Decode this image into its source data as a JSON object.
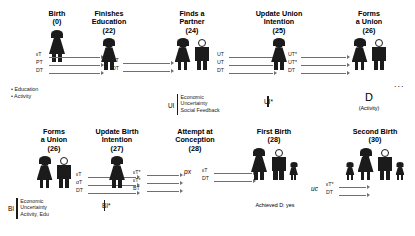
{
  "diagram": {
    "row1": {
      "nodes": [
        {
          "id": "birth",
          "title": "Birth",
          "age": "(0)",
          "figures": [
            "woman"
          ],
          "bullets": "• Education\n• Activity"
        },
        {
          "id": "finishes-education",
          "title": "Finishes\nEducation",
          "age": "(22)",
          "figures": [
            "woman"
          ]
        },
        {
          "id": "finds-a-partner",
          "title": "Finds a\nPartner",
          "age": "(24)",
          "figures": [
            "woman",
            "man"
          ],
          "annotation": {
            "key": "UI",
            "lines": "Economic\nUncertainty\nSocial Feedback"
          }
        },
        {
          "id": "update-union-intention",
          "title": "Update Union\nIntention",
          "age": "(25)",
          "figures": [
            "woman"
          ],
          "annotation": {
            "key": "UI*",
            "lines": ""
          }
        },
        {
          "id": "forms-a-union",
          "title": "Forms\na Union",
          "age": "(26)",
          "figures": [
            "woman",
            "man"
          ],
          "bigletter": "D",
          "sublabel": "(Activity)",
          "trailing": "..."
        }
      ],
      "arrow_groups": [
        {
          "id": "birth-to-education",
          "labels": [
            "εT",
            "PT",
            "DT"
          ]
        },
        {
          "id": "education-to-partner",
          "labels": [
            "PT",
            "DT"
          ]
        },
        {
          "id": "partner-to-union-intention",
          "labels": [
            "UT",
            "UT",
            "DT"
          ]
        },
        {
          "id": "union-intention-to-union",
          "labels": [
            "UT*",
            "UT*",
            "DT"
          ]
        }
      ]
    },
    "row2": {
      "nodes": [
        {
          "id": "forms-a-union-2",
          "title": "Forms\na Union",
          "age": "(26)",
          "figures": [
            "woman",
            "man"
          ],
          "annotation": {
            "key": "BI",
            "lines": "Economic\nUncertainty\nActivity, Edu"
          }
        },
        {
          "id": "update-birth-intention",
          "title": "Update Birth\nIntention",
          "age": "(27)",
          "figures": [
            "woman"
          ],
          "annotation": {
            "key": "BI*",
            "lines": ""
          }
        },
        {
          "id": "attempt-at-conception",
          "title": "Attempt at\nConception",
          "age": "(28)",
          "figures": [],
          "param": "px"
        },
        {
          "id": "first-birth",
          "title": "First Birth",
          "age": "(28)",
          "figures": [
            "woman",
            "man",
            "child"
          ],
          "sublabel": "Achieved D: yes",
          "param": "uc"
        },
        {
          "id": "second-birth",
          "title": "Second Birth",
          "age": "(30)",
          "figures": [
            "child",
            "woman",
            "man",
            "child"
          ]
        }
      ],
      "arrow_groups": [
        {
          "id": "union-to-birth-intention",
          "labels": [
            "εT",
            "αT",
            "DT"
          ]
        },
        {
          "id": "birth-intention-to-conception",
          "labels": [
            "εT*",
            "εT*",
            "BT"
          ]
        },
        {
          "id": "conception-to-first-birth",
          "labels": [
            "εT",
            "DT"
          ]
        },
        {
          "id": "first-to-second-birth",
          "labels": [
            "εT*",
            "DT"
          ]
        }
      ]
    }
  }
}
